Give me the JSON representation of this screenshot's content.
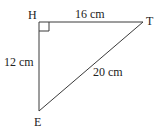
{
  "diagram": {
    "type": "right-triangle",
    "vertices": [
      {
        "id": "H",
        "label": "H",
        "x": 39,
        "y": 22,
        "right_angle": true
      },
      {
        "id": "T",
        "label": "T",
        "x": 143,
        "y": 22
      },
      {
        "id": "E",
        "label": "E",
        "x": 39,
        "y": 111
      }
    ],
    "sides": [
      {
        "from": "H",
        "to": "T",
        "label": "16 cm"
      },
      {
        "from": "H",
        "to": "E",
        "label": "12 cm"
      },
      {
        "from": "E",
        "to": "T",
        "label": "20 cm"
      }
    ],
    "colors": {
      "stroke": "#3a3a3a",
      "text": "#222222",
      "background": "#ffffff"
    }
  }
}
